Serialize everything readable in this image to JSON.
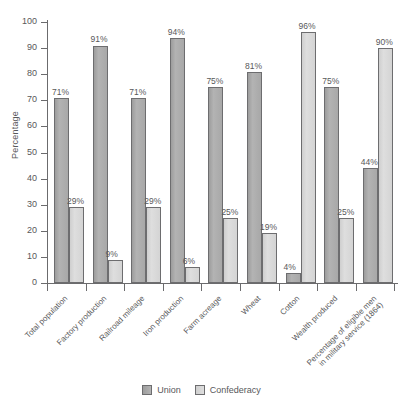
{
  "chart_data": {
    "type": "bar",
    "title": "",
    "xlabel": "",
    "ylabel": "Percentage",
    "ylim": [
      0,
      100
    ],
    "ytick_step": 10,
    "yticks": [
      "100",
      "90",
      "80",
      "70",
      "60",
      "50",
      "40",
      "30",
      "20",
      "10",
      "0"
    ],
    "grid": false,
    "legend_position": "bottom-center",
    "value_suffix": "%",
    "categories": [
      "Total population",
      "Factory production",
      "Railroad mileage",
      "Iron production",
      "Farm acreage",
      "Wheat",
      "Cotton",
      "Wealth produced",
      "Percentage of eligible men\nin military service (1864)"
    ],
    "series": [
      {
        "name": "Union",
        "color": "#a8a8a8",
        "values": [
          71,
          91,
          71,
          94,
          75,
          81,
          4,
          75,
          44
        ],
        "labels": [
          "71%",
          "91%",
          "71%",
          "94%",
          "75%",
          "81%",
          "4%",
          "75%",
          "44%"
        ]
      },
      {
        "name": "Confederacy",
        "color": "#d4d4d4",
        "values": [
          29,
          9,
          29,
          6,
          25,
          19,
          96,
          25,
          90
        ],
        "labels": [
          "29%",
          "9%",
          "29%",
          "6%",
          "25%",
          "19%",
          "96%",
          "25%",
          "90%"
        ]
      }
    ]
  },
  "legend": {
    "items": [
      {
        "label": "Union",
        "swatch": "union-swatch"
      },
      {
        "label": "Confederacy",
        "swatch": "confederacy-swatch"
      }
    ]
  }
}
